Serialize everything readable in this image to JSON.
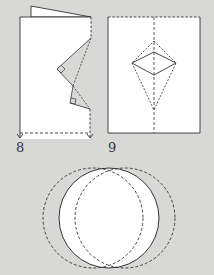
{
  "figure": {
    "type": "paper-folding instructions",
    "background_color": "#d8d8d6",
    "paper_color": "#ffffff",
    "line_color": "#333333"
  },
  "steps": [
    {
      "number": "8",
      "description": "Folded paper with zigzag cut edge (two right-angle notches), back flap raised, dashed fold line near bottom with downward arrows"
    },
    {
      "number": "9",
      "description": "Unfolded paper with vertical dashed center fold and diamond/kite crease pattern"
    }
  ],
  "bottom_figure": {
    "description": "Two overlapping dashed circles with the solid lens-shaped intersection filled white"
  }
}
